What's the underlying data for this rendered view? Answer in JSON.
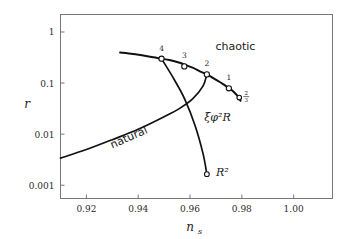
{
  "chart_data": {
    "type": "line",
    "title": "",
    "xlabel": "n_s",
    "ylabel": "r",
    "xlabel_text": "n",
    "xlabel_sub": "s",
    "ylabel_text": "r",
    "xlim": [
      0.91,
      1.015
    ],
    "ylim": [
      0.00055,
      2.2
    ],
    "yscale": "log",
    "xscale": "linear",
    "grid": false,
    "legend": null,
    "xticks": [
      0.92,
      0.94,
      0.96,
      0.98,
      1.0
    ],
    "xticklabels": [
      "0.92",
      "0.94",
      "0.96",
      "0.98",
      "1.00"
    ],
    "yticks": [
      1,
      0.1,
      0.01,
      0.001
    ],
    "yticklabels": [
      "1",
      "0.1",
      "0.01",
      "0.001"
    ],
    "series": [
      {
        "name": "chaotic",
        "label": "chaotic",
        "label_x": 0.9775,
        "label_y": 0.45,
        "x": [
          0.933,
          0.938,
          0.943,
          0.946,
          0.949,
          0.952,
          0.956,
          0.958,
          0.961,
          0.964,
          0.9665,
          0.969,
          0.9715,
          0.9735,
          0.975,
          0.9765,
          0.9778,
          0.9788,
          0.9795
        ],
        "y": [
          0.395,
          0.37,
          0.34,
          0.32,
          0.3,
          0.283,
          0.25,
          0.228,
          0.2,
          0.168,
          0.148,
          0.125,
          0.105,
          0.09,
          0.08,
          0.07,
          0.06,
          0.053,
          0.045
        ]
      },
      {
        "name": "natural",
        "label": "natural",
        "label_x": 0.93,
        "label_y": 0.0052,
        "label_rotation": -24,
        "x": [
          0.91,
          0.92,
          0.93,
          0.94,
          0.95,
          0.956,
          0.961,
          0.965,
          0.9665
        ],
        "y": [
          0.0034,
          0.005,
          0.0078,
          0.0125,
          0.022,
          0.032,
          0.049,
          0.087,
          0.148
        ]
      },
      {
        "name": "xi phi^2 R",
        "label": "ξφ²R",
        "label_x": 0.9655,
        "label_y": 0.0185,
        "x": [
          0.949,
          0.954,
          0.958,
          0.962,
          0.965,
          0.9665
        ],
        "y": [
          0.3,
          0.115,
          0.048,
          0.0145,
          0.0042,
          0.00165
        ]
      },
      {
        "name": "R^2",
        "label": "R²",
        "label_x": 0.97,
        "label_y": 0.00155,
        "point_x": 0.9665,
        "point_y": 0.00165
      }
    ],
    "markers": [
      {
        "label": "4",
        "x": 0.949,
        "y": 0.3,
        "label_dx": 0,
        "label_dy": -8
      },
      {
        "label": "3",
        "x": 0.9578,
        "y": 0.212,
        "label_dx": 0,
        "label_dy": -8
      },
      {
        "label": "2",
        "x": 0.9665,
        "y": 0.148,
        "label_dx": 0,
        "label_dy": -8
      },
      {
        "label": "1",
        "x": 0.975,
        "y": 0.079,
        "label_dx": 0,
        "label_dy": -8
      }
    ],
    "fraction_marker": {
      "numerator": "2",
      "denominator": "3",
      "x": 0.979,
      "y": 0.052
    },
    "annotations": [
      {
        "text": "chaotic"
      },
      {
        "text": "natural"
      },
      {
        "text": "ξφ²R"
      },
      {
        "text": "R²"
      }
    ]
  },
  "figure": {
    "background": "#ffffff",
    "frame_color": "#777777",
    "curve_color": "#111111",
    "marker_fill": "#ffffff"
  }
}
